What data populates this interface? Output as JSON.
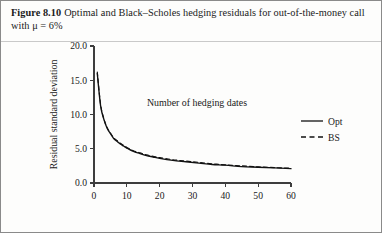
{
  "figure": {
    "label": "Figure 8.10",
    "caption": "Optimal and Black–Scholes hedging residuals for out-of-the-money call with μ = 6%"
  },
  "chart_data": {
    "type": "line",
    "title": "",
    "xlabel": "Number of hedging dates",
    "ylabel": "Residual standard deviation",
    "xlim": [
      0,
      60
    ],
    "ylim": [
      0,
      20
    ],
    "xticks": [
      "0",
      "10",
      "20",
      "30",
      "40",
      "50",
      "60"
    ],
    "xtick_values": [
      0,
      10,
      20,
      30,
      40,
      50,
      60
    ],
    "yticks": [
      "0.0",
      "5.0",
      "10.0",
      "15.0",
      "20.0"
    ],
    "ytick_values": [
      0,
      5,
      10,
      15,
      20
    ],
    "grid": false,
    "legend_position": "right",
    "x": [
      1,
      2,
      3,
      4,
      5,
      6,
      7,
      8,
      9,
      10,
      12,
      14,
      16,
      18,
      20,
      24,
      28,
      32,
      36,
      40,
      45,
      50,
      55,
      60
    ],
    "series": [
      {
        "name": "Opt",
        "style": "solid",
        "values": [
          16.0,
          11.3,
          9.3,
          8.0,
          7.2,
          6.5,
          6.1,
          5.7,
          5.4,
          5.1,
          4.6,
          4.3,
          4.0,
          3.8,
          3.6,
          3.3,
          3.1,
          2.9,
          2.7,
          2.6,
          2.4,
          2.3,
          2.2,
          2.1
        ]
      },
      {
        "name": "BS",
        "style": "dashed",
        "values": [
          16.2,
          11.5,
          9.4,
          8.1,
          7.3,
          6.6,
          6.2,
          5.8,
          5.5,
          5.2,
          4.7,
          4.4,
          4.1,
          3.9,
          3.7,
          3.4,
          3.2,
          3.0,
          2.8,
          2.65,
          2.5,
          2.35,
          2.25,
          2.15
        ]
      }
    ]
  },
  "legend": {
    "entries": [
      {
        "label": "Opt",
        "style": "solid"
      },
      {
        "label": "BS",
        "style": "dashed"
      }
    ]
  }
}
